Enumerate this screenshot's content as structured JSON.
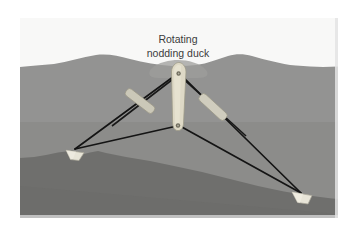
{
  "figure": {
    "kind": "technical-illustration",
    "label": {
      "line1": "Rotating",
      "line2": "nodding duck",
      "color": "#3b3b3b",
      "x": 158,
      "y_line1": 22,
      "y_line2": 36
    },
    "colors": {
      "sky": "#f8f8f7",
      "water_upper": "#919190",
      "water_lower": "#8b8b89",
      "seabed": "#6f6f6d",
      "body_fill": "#ded9c6",
      "body_stroke": "#9a9684",
      "damper_fill": "#cdcabb",
      "anchor_fill": "#e6e3d6",
      "cable": "#1b1b1b",
      "frame_shadow": "#d9d9d9"
    },
    "water_surface_label": "sea surface with wave crests",
    "seabed_label": "sloping sea floor",
    "duck_body": {
      "name": "rotating nodding duck body",
      "cx": 158,
      "top_y": 48,
      "bottom_y": 112,
      "pivot_top": {
        "x": 158,
        "y": 55
      },
      "pivot_bottom": {
        "x": 158,
        "y": 108
      }
    },
    "struts": [
      {
        "name": "left strut damper",
        "x1": 158,
        "y1": 60,
        "x2": 104,
        "y2": 104
      },
      {
        "name": "right strut damper",
        "x1": 158,
        "y1": 60,
        "x2": 212,
        "y2": 112
      }
    ],
    "anchors": [
      {
        "name": "left seabed anchor",
        "x": 52,
        "y": 132
      },
      {
        "name": "right seabed anchor",
        "x": 278,
        "y": 175
      }
    ],
    "mooring_cables": [
      {
        "name": "cable-upper-left",
        "from": "duck-pivot-top",
        "to": "left-anchor"
      },
      {
        "name": "cable-lower-left",
        "from": "duck-pivot-bottom",
        "to": "left-anchor"
      },
      {
        "name": "cable-upper-right",
        "from": "duck-pivot-top",
        "to": "right-anchor"
      },
      {
        "name": "cable-lower-right",
        "from": "duck-pivot-bottom",
        "to": "right-anchor"
      }
    ]
  }
}
